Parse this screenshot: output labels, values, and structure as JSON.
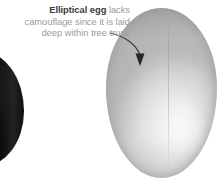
{
  "figure": {
    "background_color": "#ffffff",
    "width": 223,
    "height": 189
  },
  "annotation": {
    "bold_text": "Elliptical egg",
    "rest_text": " lacks camouflage since it is laid deep within tree trunk",
    "full_text": "Elliptical egg lacks camouflage since it is laid deep within tree trunk",
    "bold_color": "#3a3a3a",
    "body_color": "#9b9b9b",
    "align": "right"
  },
  "arrow": {
    "label": "callout-arrow",
    "color": "#3a3a3a",
    "path": "M 110 33 C 124 36, 136 44, 140 55",
    "head_points": "140,66 135.5,53.5 144.5,53.5"
  },
  "eggs": [
    {
      "name": "dark-egg-partial",
      "description": "Dark egg partially cropped at left edge",
      "color_light": "#5b5b5b",
      "color_dark": "#090909"
    },
    {
      "name": "elliptical-egg",
      "description": "Large pale elliptical egg with smooth shell, no camouflage",
      "color_light": "#f4f4f2",
      "color_dark": "#bcbcba"
    }
  ]
}
